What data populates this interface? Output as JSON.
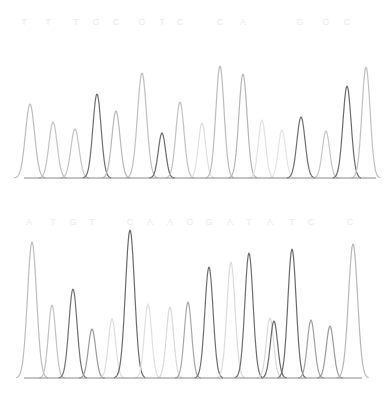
{
  "chart_data": [
    {
      "type": "line",
      "title": "",
      "subtitle": "DNA sequencing chromatogram (upper trace)",
      "xlabel": "",
      "ylabel": "",
      "grid": false,
      "legend": null,
      "base_calls": [
        "T",
        "T",
        "T",
        "G",
        "C",
        "G",
        "T",
        "C",
        "C",
        "A",
        "G",
        "G",
        "C"
      ],
      "base_call_x": [
        24,
        48,
        76,
        96,
        116,
        142,
        162,
        180,
        220,
        243,
        300,
        326,
        347
      ],
      "baseline_y": 178,
      "peaks": [
        {
          "x": 30,
          "top": 104,
          "width": 10,
          "shade": "#bdbdbd"
        },
        {
          "x": 53,
          "top": 122,
          "width": 9,
          "shade": "#c4c4c4"
        },
        {
          "x": 75,
          "top": 129,
          "width": 9,
          "shade": "#c4c4c4"
        },
        {
          "x": 97,
          "top": 94,
          "width": 9,
          "shade": "#6e6e6e"
        },
        {
          "x": 116,
          "top": 111,
          "width": 9,
          "shade": "#b8b8b8"
        },
        {
          "x": 142,
          "top": 73,
          "width": 10,
          "shade": "#c0c0c0"
        },
        {
          "x": 162,
          "top": 133,
          "width": 8,
          "shade": "#6a6a6a"
        },
        {
          "x": 180,
          "top": 102,
          "width": 9,
          "shade": "#c2c2c2"
        },
        {
          "x": 202,
          "top": 123,
          "width": 8,
          "shade": "#e0e0e0"
        },
        {
          "x": 220,
          "top": 66,
          "width": 9,
          "shade": "#bcbcbc"
        },
        {
          "x": 243,
          "top": 74,
          "width": 9,
          "shade": "#b6b6b6"
        },
        {
          "x": 262,
          "top": 120,
          "width": 8,
          "shade": "#e2e2e2"
        },
        {
          "x": 282,
          "top": 130,
          "width": 8,
          "shade": "#e4e4e4"
        },
        {
          "x": 301,
          "top": 117,
          "width": 9,
          "shade": "#6e6e6e"
        },
        {
          "x": 326,
          "top": 131,
          "width": 8,
          "shade": "#c6c6c6"
        },
        {
          "x": 347,
          "top": 86,
          "width": 9,
          "shade": "#6a6a6a"
        },
        {
          "x": 366,
          "top": 67,
          "width": 9,
          "shade": "#c0c0c0"
        }
      ],
      "x_range": [
        24,
        376
      ],
      "y_range_px": [
        60,
        178
      ]
    },
    {
      "type": "line",
      "title": "",
      "subtitle": "DNA sequencing chromatogram (lower trace)",
      "xlabel": "",
      "ylabel": "",
      "grid": false,
      "legend": null,
      "base_calls": [
        "A",
        "T",
        "G",
        "T",
        "C",
        "A",
        "A",
        "G",
        "G",
        "A",
        "T",
        "A",
        "T",
        "C",
        "C"
      ],
      "base_call_x": [
        29,
        53,
        73,
        92,
        130,
        150,
        170,
        190,
        209,
        230,
        249,
        270,
        292,
        311,
        350
      ],
      "baseline_y": 378,
      "peaks": [
        {
          "x": 32,
          "top": 242,
          "width": 10,
          "shade": "#bdbdbd"
        },
        {
          "x": 52,
          "top": 305,
          "width": 8,
          "shade": "#c2c2c2"
        },
        {
          "x": 73,
          "top": 289,
          "width": 9,
          "shade": "#707070"
        },
        {
          "x": 92,
          "top": 329,
          "width": 8,
          "shade": "#9a9a9a"
        },
        {
          "x": 112,
          "top": 319,
          "width": 8,
          "shade": "#dedede"
        },
        {
          "x": 130,
          "top": 230,
          "width": 10,
          "shade": "#6a6a6a"
        },
        {
          "x": 148,
          "top": 304,
          "width": 8,
          "shade": "#e0e0e0"
        },
        {
          "x": 170,
          "top": 307,
          "width": 8,
          "shade": "#dadada"
        },
        {
          "x": 188,
          "top": 302,
          "width": 8,
          "shade": "#a8a8a8"
        },
        {
          "x": 209,
          "top": 267,
          "width": 9,
          "shade": "#6e6e6e"
        },
        {
          "x": 231,
          "top": 262,
          "width": 9,
          "shade": "#dcdcdc"
        },
        {
          "x": 249,
          "top": 253,
          "width": 9,
          "shade": "#6e6e6e"
        },
        {
          "x": 270,
          "top": 318,
          "width": 8,
          "shade": "#dadada"
        },
        {
          "x": 274,
          "top": 321,
          "width": 8,
          "shade": "#6a6a6a"
        },
        {
          "x": 292,
          "top": 249,
          "width": 9,
          "shade": "#6a6a6a"
        },
        {
          "x": 311,
          "top": 320,
          "width": 8,
          "shade": "#a0a0a0"
        },
        {
          "x": 330,
          "top": 326,
          "width": 8,
          "shade": "#9a9a9a"
        },
        {
          "x": 353,
          "top": 244,
          "width": 10,
          "shade": "#b8b8b8"
        }
      ],
      "x_range": [
        24,
        362
      ],
      "y_range_px": [
        228,
        378
      ]
    }
  ],
  "colors": {
    "background": "#ffffff",
    "baseline": "#8a8a8a",
    "dark_trace": "#6a6a6a",
    "light_trace": "#c0c0c0",
    "faint_trace": "#e0e0e0",
    "base_letters": "#ececec"
  }
}
